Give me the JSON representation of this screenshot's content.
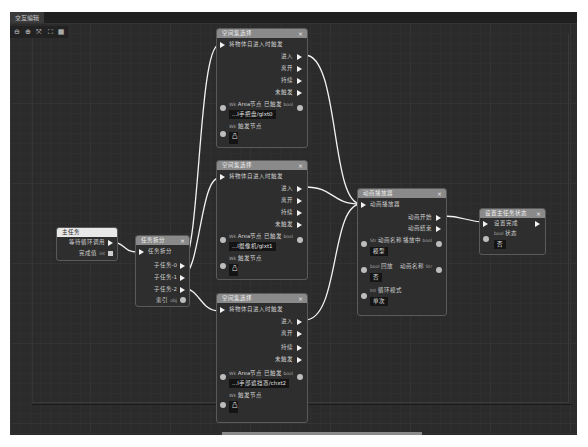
{
  "window": {
    "tab_label": "交互编辑"
  },
  "toolbar": {
    "buttons": [
      "zoom-out",
      "zoom-in",
      "fit",
      "fullscreen",
      "grid"
    ],
    "glyphs": [
      "⊖",
      "⊕",
      "⤧",
      "⛶",
      "▦"
    ]
  },
  "nodes": {
    "main_task": {
      "title": "主任务",
      "outputs": [
        {
          "label": "等待循环调用",
          "type": "exec"
        },
        {
          "label": "完成值",
          "tag": "int",
          "type": "data"
        }
      ]
    },
    "task_split": {
      "title": "任务拆分",
      "input": "任务拆分",
      "outputs": [
        "子任务-0",
        "子任务-1",
        "子任务-2"
      ],
      "data_out": {
        "label": "索引",
        "tag": "obj"
      }
    },
    "space_a": {
      "title": "空间集选择",
      "input": "将物体自进入时触发",
      "outputs": [
        "进入",
        "离开",
        "持续",
        "未触发"
      ],
      "area_label": "Area节点",
      "area_tag": "Wk",
      "set_label": "已触发",
      "set_tag": "bool",
      "path_value": "...l手把盘/glxt0",
      "data_label": "触发节点",
      "data_tag": "Wk",
      "data_value": "凸"
    },
    "space_b": {
      "title": "空间集选择",
      "input": "将物体自进入时触发",
      "outputs": [
        "进入",
        "离开",
        "持续",
        "未触发"
      ],
      "area_label": "Area节点",
      "area_tag": "Wk",
      "set_label": "已触发",
      "set_tag": "bool",
      "path_value": "...l摄像机/glxt1",
      "data_label": "触发节点",
      "data_tag": "Wk",
      "data_value": "凸"
    },
    "space_c": {
      "title": "空间集选择",
      "input": "将物体自进入时触发",
      "outputs": [
        "进入",
        "离开",
        "持续",
        "未触发"
      ],
      "area_label": "Area节点",
      "area_tag": "Wk",
      "set_label": "已触发",
      "set_tag": "bool",
      "path_value": "...l手部遮挡罩/chxt2",
      "data_label": "触发节点",
      "data_tag": "Wk",
      "data_value": "凸"
    },
    "merge": {
      "title": "动画播放器",
      "input": "动画播放器",
      "outputs": [
        "动画开始",
        "动画结束"
      ],
      "p1_label": "动画名称",
      "p1_tag": "Str",
      "p1_right": "播放中",
      "p1_right_tag": "bool",
      "p1_value": "模型",
      "p2_label": "回放",
      "p2_tag": "bool",
      "p2_right": "动画名称",
      "p2_right_tag": "Str",
      "p2_value": "否",
      "p3_label": "循环模式",
      "p3_tag": "Int",
      "p3_value": "单次"
    },
    "end": {
      "title": "设置主任务状态",
      "input": "设置完成",
      "data_label": "状态",
      "data_tag": "bool",
      "data_value": "否"
    }
  },
  "colors": {
    "canvas": "#2b2b2b",
    "wire": "#f2f2f2",
    "header": "#8a8a8a",
    "node_bg": "#2e2e2e"
  }
}
